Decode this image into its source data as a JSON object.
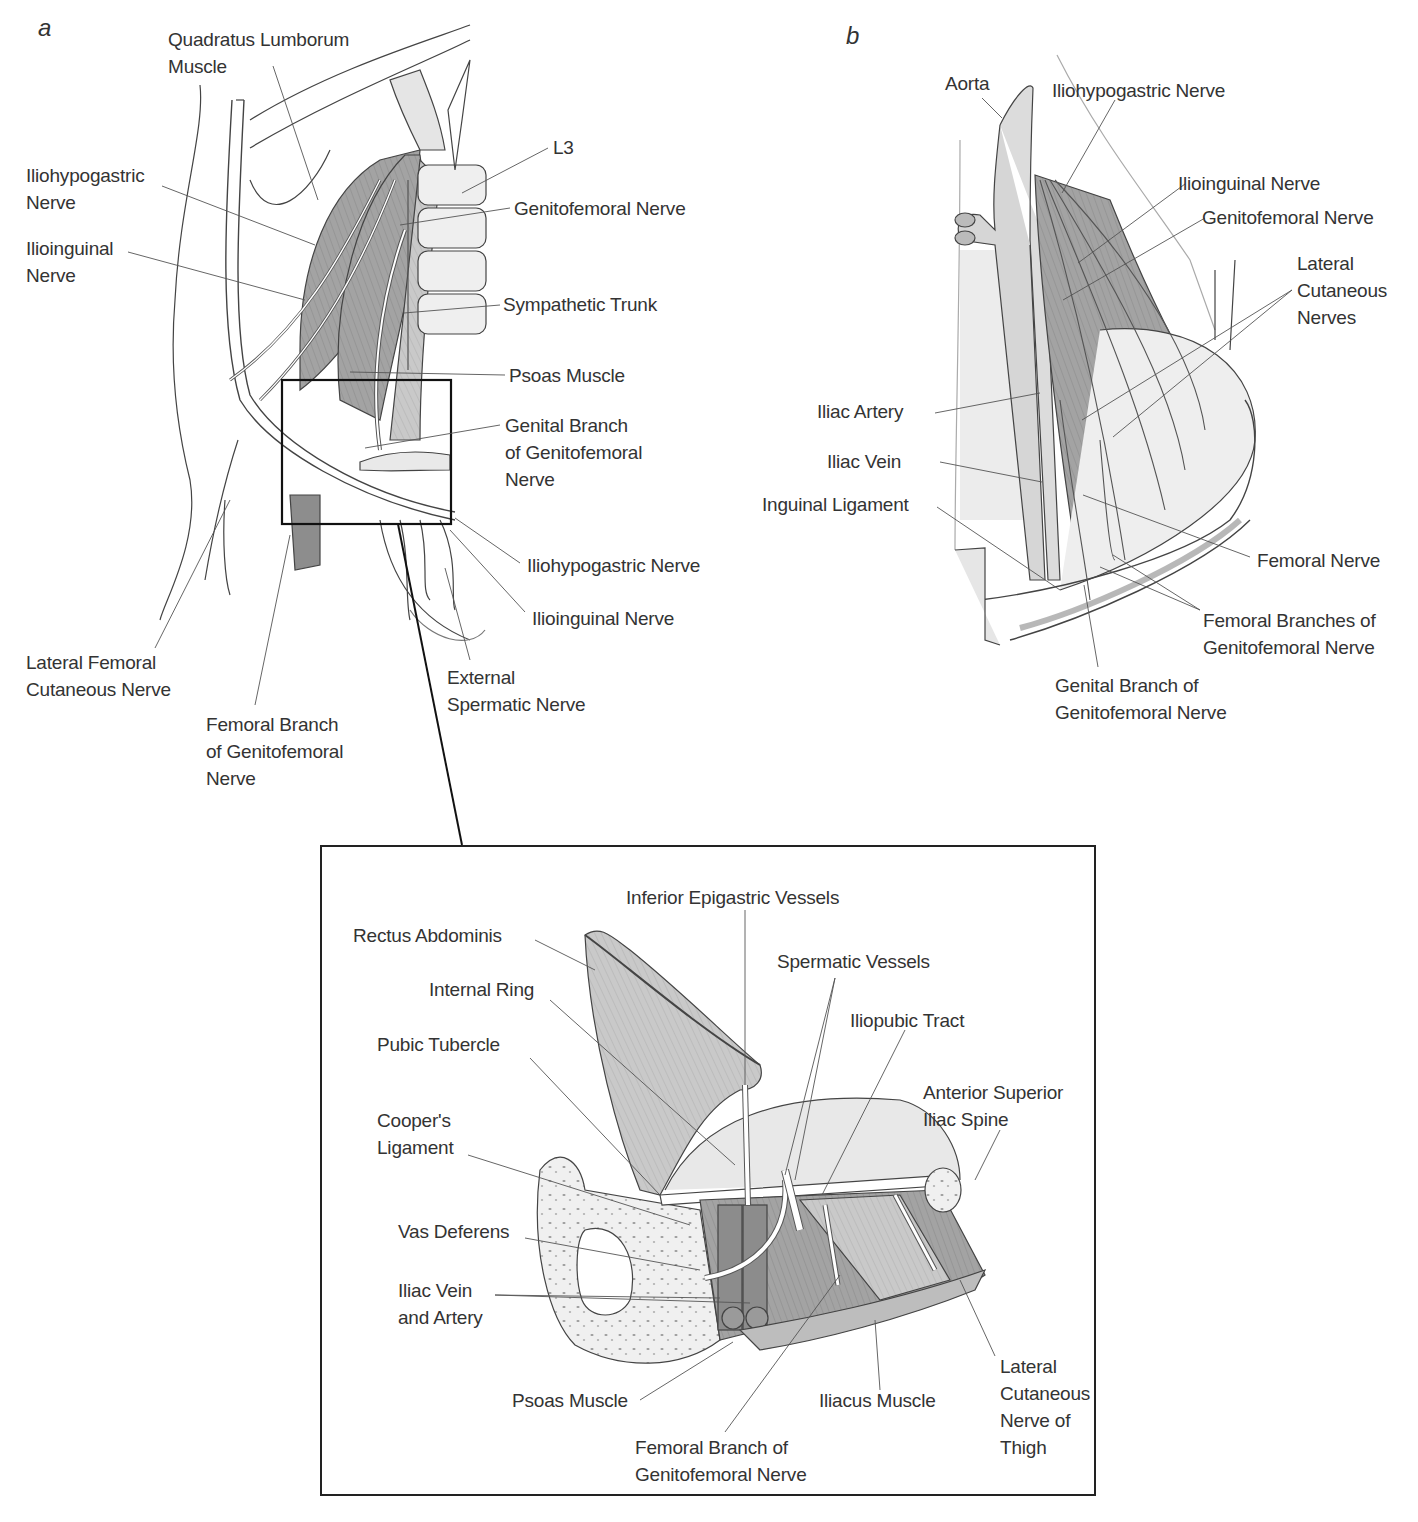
{
  "figure": {
    "panels": {
      "a": {
        "letter": "a",
        "labels": {
          "quadratus_lumborum": "Quadratus Lumborum\nMuscle",
          "iliohypogastric_left": "Iliohypogastric\nNerve",
          "ilioinguinal_left": "Ilioinguinal\nNerve",
          "l3": "L3",
          "genitofemoral": "Genitofemoral Nerve",
          "sympathetic_trunk": "Sympathetic Trunk",
          "psoas": "Psoas Muscle",
          "genital_branch": "Genital Branch\nof Genitofemoral\nNerve",
          "iliohypogastric_right": "Iliohypogastric Nerve",
          "ilioinguinal_right": "Ilioinguinal Nerve",
          "external_spermatic": "External\nSpermatic Nerve",
          "lateral_femoral_cutaneous": "Lateral Femoral\nCutaneous Nerve",
          "femoral_branch": "Femoral Branch\nof Genitofemoral\nNerve"
        }
      },
      "b": {
        "letter": "b",
        "labels": {
          "aorta": "Aorta",
          "iliohypogastric": "Iliohypogastric Nerve",
          "ilioinguinal": "Ilioinguinal Nerve",
          "genitofemoral": "Genitofemoral Nerve",
          "lateral_cutaneous": "Lateral\nCutaneous\nNerves",
          "iliac_artery": "Iliac Artery",
          "iliac_vein": "Iliac Vein",
          "inguinal_ligament": "Inguinal Ligament",
          "femoral_nerve": "Femoral Nerve",
          "femoral_branches": "Femoral Branches of\nGenitofemoral Nerve",
          "genital_branch": "Genital Branch of\nGenitofemoral Nerve"
        }
      },
      "inset": {
        "labels": {
          "inferior_epigastric": "Inferior Epigastric Vessels",
          "rectus_abdominis": "Rectus Abdominis",
          "spermatic_vessels": "Spermatic Vessels",
          "internal_ring": "Internal Ring",
          "iliopubic_tract": "Iliopubic Tract",
          "pubic_tubercle": "Pubic Tubercle",
          "anterior_superior_iliac_spine": "Anterior Superior\nIliac Spine",
          "coopers_ligament": "Cooper's\nLigament",
          "vas_deferens": "Vas Deferens",
          "iliac_vein_artery": "Iliac Vein\nand Artery",
          "psoas": "Psoas Muscle",
          "iliacus": "Iliacus Muscle",
          "lateral_cutaneous_thigh": "Lateral\nCutaneous\nNerve of\nThigh",
          "femoral_branch": "Femoral Branch of\nGenitofemoral Nerve"
        }
      }
    },
    "colors": {
      "ink": "#333333",
      "muscle": "#9a9a9a",
      "muscle_light": "#c8c8c8",
      "bone": "#eeeeee",
      "line": "#555555"
    }
  }
}
